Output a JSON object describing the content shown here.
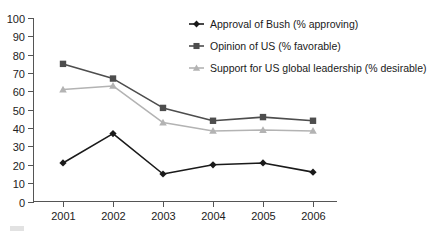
{
  "chart_data": {
    "type": "line",
    "title": "",
    "xlabel": "",
    "ylabel": "",
    "categories": [
      "2001",
      "2002",
      "2003",
      "2004",
      "2005",
      "2006"
    ],
    "x_tick_labels": [
      "2001",
      "2002",
      "2003",
      "2004",
      "2005",
      "2006"
    ],
    "y_tick_labels": [
      "0",
      "10",
      "20",
      "30",
      "40",
      "50",
      "60",
      "70",
      "80",
      "90",
      "100"
    ],
    "y_ticks": [
      0,
      10,
      20,
      30,
      40,
      50,
      60,
      70,
      80,
      90,
      100
    ],
    "ylim": [
      0,
      100
    ],
    "grid": false,
    "legend_position": "top-right-inside",
    "series": [
      {
        "name": "Approval of Bush (% approving)",
        "marker": "diamond",
        "color": "#1a1a1a",
        "values": [
          21,
          37,
          15,
          20,
          21,
          16
        ]
      },
      {
        "name": "Opinion of US (% favorable)",
        "marker": "square",
        "color": "#4d4d4d",
        "values": [
          75,
          67,
          51,
          44,
          46,
          44
        ]
      },
      {
        "name": "Support for US global leadership (% desirable)",
        "marker": "triangle",
        "color": "#b3b3b3",
        "values": [
          61,
          63,
          43,
          38.5,
          39,
          38.5
        ]
      }
    ]
  },
  "legend": {
    "items": [
      {
        "label": "Approval of Bush (% approving)"
      },
      {
        "label": "Opinion of US (% favorable)"
      },
      {
        "label": "Support for US global leadership (% desirable)"
      }
    ]
  },
  "colors": {
    "series_1": "#1a1a1a",
    "series_2": "#4d4d4d",
    "series_3": "#b3b3b3",
    "axis": "#555555",
    "background": "#ffffff"
  }
}
